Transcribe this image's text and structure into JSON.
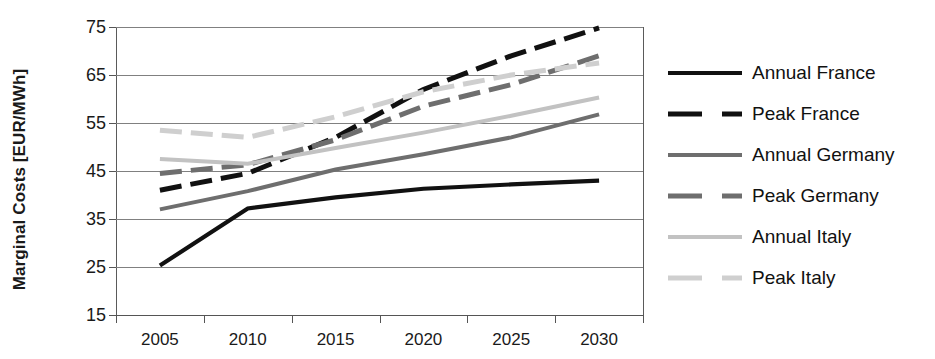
{
  "chart_data": {
    "type": "line",
    "title": "",
    "xlabel": "",
    "ylabel": "Marginal Costs [EUR/MWh]",
    "categories": [
      "2005",
      "2010",
      "2015",
      "2020",
      "2025",
      "2030"
    ],
    "ylim": [
      15,
      75
    ],
    "yticks": [
      15,
      25,
      35,
      45,
      55,
      65,
      75
    ],
    "grid": true,
    "legend_position": "right",
    "series": [
      {
        "name": "Annual France",
        "values": [
          25.3,
          37.2,
          39.5,
          41.3,
          42.2,
          43.0
        ],
        "color": "#111111",
        "style": "solid",
        "width": 4.2
      },
      {
        "name": "Peak France",
        "values": [
          41.0,
          44.5,
          52.0,
          62.0,
          69.0,
          74.8
        ],
        "color": "#111111",
        "style": "dashed",
        "width": 5.0
      },
      {
        "name": "Annual Germany",
        "values": [
          37.0,
          40.8,
          45.3,
          48.5,
          52.0,
          56.8
        ],
        "color": "#6e6e6e",
        "style": "solid",
        "width": 4.0
      },
      {
        "name": "Peak Germany",
        "values": [
          44.5,
          46.3,
          51.5,
          58.5,
          63.0,
          69.0
        ],
        "color": "#6e6e6e",
        "style": "dashed",
        "width": 5.0
      },
      {
        "name": "Annual Italy",
        "values": [
          47.5,
          46.5,
          49.8,
          53.0,
          56.5,
          60.3
        ],
        "color": "#c2c2c2",
        "style": "solid",
        "width": 4.0
      },
      {
        "name": "Peak Italy",
        "values": [
          53.5,
          52.0,
          56.3,
          61.5,
          65.0,
          67.5
        ],
        "color": "#cfcfcf",
        "style": "dashed",
        "width": 5.0
      }
    ]
  },
  "axes": {
    "y_title": "Marginal Costs [EUR/MWh]",
    "y_tick_labels": [
      "75",
      "65",
      "55",
      "45",
      "35",
      "25",
      "15"
    ],
    "x_tick_labels": [
      "2005",
      "2010",
      "2015",
      "2020",
      "2025",
      "2030"
    ]
  },
  "legend": {
    "items": [
      {
        "label": "Annual France"
      },
      {
        "label": "Peak France"
      },
      {
        "label": "Annual Germany"
      },
      {
        "label": "Peak Germany"
      },
      {
        "label": "Annual Italy"
      },
      {
        "label": "Peak Italy"
      }
    ]
  }
}
